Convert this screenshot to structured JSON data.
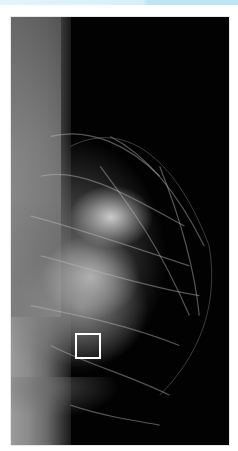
{
  "image": {
    "type": "mammogram",
    "view": "mediolateral oblique",
    "description": "Grayscale mammography X-ray image of breast tissue with a white rectangular region-of-interest box in the lower-left area",
    "roi_box": {
      "x": 74,
      "y": 332,
      "width": 27,
      "height": 27,
      "color": "#ffffff"
    },
    "frame": {
      "x": 10,
      "y": 16,
      "width": 220,
      "height": 430
    }
  },
  "colors": {
    "background": "#ffffff",
    "image_background": "#020202",
    "top_bar": "#d8eff8",
    "roi": "#ffffff"
  }
}
